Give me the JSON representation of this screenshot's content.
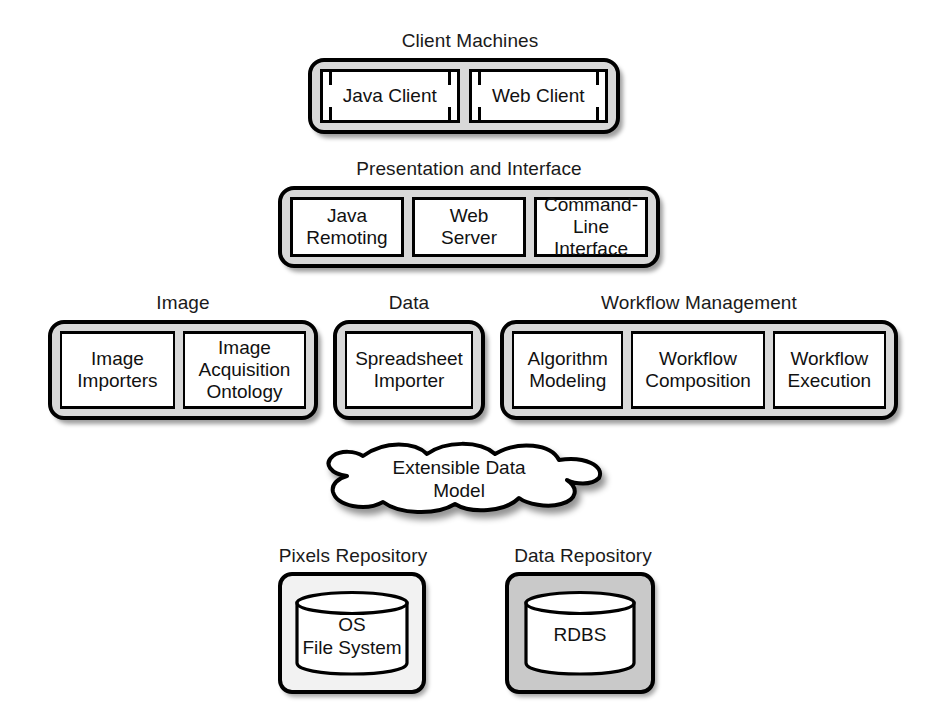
{
  "diagram": {
    "colors": {
      "tier_fill": "#d8d8d8",
      "cell_fill": "#ffffff",
      "outline": "#000000",
      "repo_light_fill": "#f2f2f2",
      "repo_dark_fill": "#c9c9c9"
    }
  },
  "tiers": {
    "clients": {
      "caption": "Client Machines",
      "items": [
        {
          "label": "Java Client"
        },
        {
          "label": "Web Client"
        }
      ]
    },
    "presentation": {
      "caption": "Presentation and Interface",
      "items": [
        {
          "label": "Java\nRemoting"
        },
        {
          "label": "Web\nServer"
        },
        {
          "label": "Command-\nLine\nInterface"
        }
      ]
    },
    "image": {
      "caption": "Image",
      "items": [
        {
          "label": "Image\nImporters"
        },
        {
          "label": "Image\nAcquisition\nOntology"
        }
      ]
    },
    "data": {
      "caption": "Data",
      "items": [
        {
          "label": "Spreadsheet\nImporter"
        }
      ]
    },
    "workflow": {
      "caption": "Workflow Management",
      "items": [
        {
          "label": "Algorithm\nModeling"
        },
        {
          "label": "Workflow\nComposition"
        },
        {
          "label": "Workflow\nExecution"
        }
      ]
    }
  },
  "cloud": {
    "label": "Extensible Data\nModel",
    "icon": "cloud-icon"
  },
  "repositories": [
    {
      "caption": "Pixels Repository",
      "store_label": "OS\nFile System",
      "icon": "database-cylinder-icon",
      "fill": "light"
    },
    {
      "caption": "Data Repository",
      "store_label": "RDBS",
      "icon": "database-cylinder-icon",
      "fill": "dark"
    }
  ]
}
